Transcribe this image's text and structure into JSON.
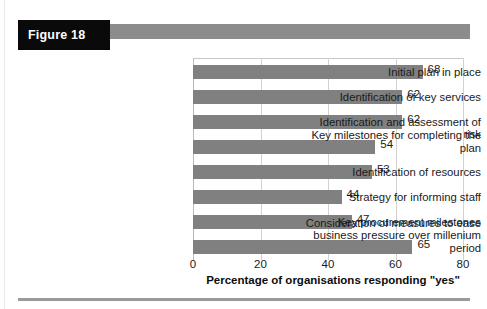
{
  "figure": {
    "tag_label": "Figure 18"
  },
  "chart_data": {
    "type": "bar",
    "orientation": "horizontal",
    "title": "",
    "xlabel": "Percentage of organisations responding \"yes\"",
    "ylabel": "",
    "xlim": [
      0,
      80
    ],
    "xticks": [
      "0",
      "20",
      "40",
      "60",
      "80"
    ],
    "xtick_values": [
      0,
      20,
      40,
      60,
      80
    ],
    "grid": true,
    "legend": "none",
    "bar_color": "#808080",
    "categories": [
      "Initial plan in place",
      "Identification of key services",
      "Identification and assessment of risk",
      "Key milestones for completing the plan",
      "Identification of resources",
      "Strategy for informing staff",
      "Key procurement milestones",
      "Consideration of measures to ease business pressure over millenium period"
    ],
    "category_lines": [
      [
        "Initial plan in place"
      ],
      [
        "Identification of key services"
      ],
      [
        "Identification and assessment of risk"
      ],
      [
        "Key milestones for completing the",
        "plan"
      ],
      [
        "Identification of resources"
      ],
      [
        "Strategy for informing staff"
      ],
      [
        "Key procurement milestones"
      ],
      [
        "Consideration of measures to ease",
        "business pressure over millenium",
        "period"
      ]
    ],
    "values": [
      68,
      62,
      62,
      54,
      53,
      44,
      47,
      65
    ],
    "value_labels": [
      "68",
      "62",
      "62",
      "54",
      "53",
      "44",
      "47",
      "65"
    ]
  }
}
